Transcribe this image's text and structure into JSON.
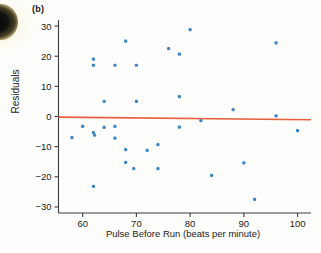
{
  "figure": {
    "panel_label": "(b)",
    "marker_color": "#3d86c6",
    "reference_line_color": "#e8603c",
    "axis_color": "#3b3b3b"
  },
  "chart_data": {
    "type": "scatter",
    "title": "",
    "panel": "(b)",
    "xlabel": "Pulse Before Run (beats per minute)",
    "ylabel": "Residuals",
    "xlim": [
      55.5,
      102.5
    ],
    "ylim": [
      -32,
      32
    ],
    "xticks": [
      60,
      70,
      80,
      90,
      100
    ],
    "yticks": [
      30,
      20,
      10,
      0,
      -10,
      -20,
      -30
    ],
    "xtick_labels": [
      "60",
      "70",
      "80",
      "90",
      "100"
    ],
    "ytick_labels": [
      "30",
      "20",
      "10",
      "0",
      "−10",
      "−20",
      "−30"
    ],
    "grid": false,
    "legend": null,
    "reference_line": {
      "label": "zero residual line",
      "x": [
        55.5,
        102.5
      ],
      "y": [
        -0.2,
        -1.1
      ]
    },
    "points": [
      {
        "x": 58.0,
        "y": -7.0
      },
      {
        "x": 60.0,
        "y": -3.3
      },
      {
        "x": 62.0,
        "y": 19.0
      },
      {
        "x": 62.0,
        "y": 17.0
      },
      {
        "x": 62.0,
        "y": -5.3
      },
      {
        "x": 62.2,
        "y": -6.2
      },
      {
        "x": 62.0,
        "y": -23.2
      },
      {
        "x": 64.0,
        "y": 5.0
      },
      {
        "x": 64.0,
        "y": -3.6
      },
      {
        "x": 66.0,
        "y": 17.0
      },
      {
        "x": 66.0,
        "y": -3.3
      },
      {
        "x": 66.0,
        "y": -7.2
      },
      {
        "x": 68.0,
        "y": 25.0
      },
      {
        "x": 68.0,
        "y": -11.0
      },
      {
        "x": 68.0,
        "y": -15.2
      },
      {
        "x": 69.5,
        "y": -17.3
      },
      {
        "x": 70.0,
        "y": 17.0
      },
      {
        "x": 70.0,
        "y": 5.0
      },
      {
        "x": 72.0,
        "y": -11.2
      },
      {
        "x": 74.0,
        "y": -9.3
      },
      {
        "x": 74.0,
        "y": -17.3
      },
      {
        "x": 76.0,
        "y": 22.5
      },
      {
        "x": 78.0,
        "y": 20.7
      },
      {
        "x": 78.0,
        "y": 6.6
      },
      {
        "x": 78.0,
        "y": -3.5
      },
      {
        "x": 80.0,
        "y": 28.8
      },
      {
        "x": 82.0,
        "y": -1.4
      },
      {
        "x": 84.0,
        "y": -19.5
      },
      {
        "x": 88.0,
        "y": 2.3
      },
      {
        "x": 90.0,
        "y": -15.4
      },
      {
        "x": 92.0,
        "y": -27.5
      },
      {
        "x": 96.0,
        "y": 24.4
      },
      {
        "x": 96.0,
        "y": 0.2
      },
      {
        "x": 100.0,
        "y": -4.7
      }
    ]
  }
}
